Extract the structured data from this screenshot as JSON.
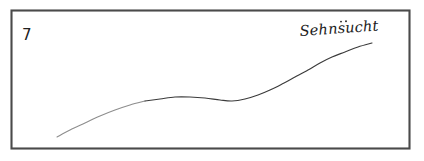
{
  "sketch": {
    "background_color": "#ffffff",
    "frame": {
      "name": "hand-drawn rectangular frame",
      "stroke_color": "#4a4a4a",
      "x": 11,
      "y": 10,
      "width": 398,
      "height": 138
    },
    "index_label": {
      "text": "7",
      "x": 22,
      "y": 40,
      "color": "#202020"
    },
    "curve_label": {
      "text": "Sehnsucht",
      "x": 300,
      "y": 36,
      "color": "#202020",
      "style": "handwritten-italic"
    },
    "curve": {
      "name": "sehnsucht-curve",
      "stroke_color": "#3b3b3b",
      "description": "gently rising S-curve: climbs from lower-left, plateaus with a slight dip mid-span, then rises steeply to upper-right",
      "start_point": [
        57,
        137
      ],
      "end_point": [
        372,
        43
      ]
    }
  },
  "chart_data": {
    "type": "line",
    "title": "Sehnsucht",
    "xlabel": "",
    "ylabel": "",
    "grid": false,
    "legend": false,
    "annotations": [
      "7",
      "Sehnsucht"
    ],
    "xlim": [
      11,
      409
    ],
    "ylim": [
      148,
      10
    ],
    "series": [
      {
        "name": "Sehnsucht",
        "points": [
          [
            57,
            137
          ],
          [
            70,
            130
          ],
          [
            85,
            123
          ],
          [
            100,
            116
          ],
          [
            115,
            110
          ],
          [
            130,
            105
          ],
          [
            145,
            101
          ],
          [
            160,
            99
          ],
          [
            175,
            97
          ],
          [
            190,
            97
          ],
          [
            205,
            98
          ],
          [
            220,
            100
          ],
          [
            232,
            101
          ],
          [
            245,
            99
          ],
          [
            258,
            95
          ],
          [
            270,
            90
          ],
          [
            282,
            84
          ],
          [
            295,
            77
          ],
          [
            308,
            70
          ],
          [
            320,
            63
          ],
          [
            332,
            57
          ],
          [
            345,
            52
          ],
          [
            358,
            47
          ],
          [
            372,
            43
          ]
        ]
      }
    ]
  }
}
